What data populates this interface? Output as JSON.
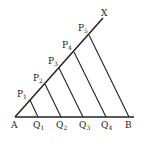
{
  "diagram": {
    "type": "line-division-construction",
    "points": {
      "A": {
        "label": "A",
        "x": 15,
        "y": 117
      },
      "B": {
        "label": "B",
        "x": 129,
        "y": 117
      },
      "X": {
        "label": "X",
        "x": 103,
        "y": 18
      }
    },
    "ray_points": [
      {
        "main": "P",
        "sub": "1",
        "x": 30,
        "y": 100
      },
      {
        "main": "P",
        "sub": "2",
        "x": 45,
        "y": 84
      },
      {
        "main": "P",
        "sub": "3",
        "x": 59,
        "y": 68
      },
      {
        "main": "P",
        "sub": "4",
        "x": 74,
        "y": 52
      },
      {
        "main": "P",
        "sub": "5",
        "x": 89,
        "y": 35
      }
    ],
    "base_points": [
      {
        "main": "Q",
        "sub": "1",
        "x": 38,
        "y": 117
      },
      {
        "main": "Q",
        "sub": "2",
        "x": 61,
        "y": 117
      },
      {
        "main": "Q",
        "sub": "3",
        "x": 83,
        "y": 117
      },
      {
        "main": "Q",
        "sub": "4",
        "x": 106,
        "y": 117
      }
    ],
    "stroke_color": "#222222",
    "background": "#ffffff"
  }
}
